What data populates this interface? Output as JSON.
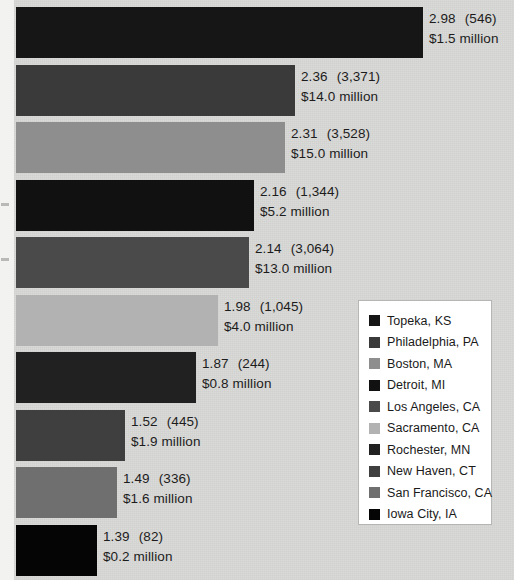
{
  "chart_data": {
    "type": "bar",
    "title": "",
    "subtitle": "",
    "xlabel": "",
    "ylabel": "",
    "orientation": "horizontal",
    "grid": false,
    "legend_position": "right",
    "xlim": [
      0,
      3.2
    ],
    "categories": [
      "Topeka, KS",
      "Philadelphia, PA",
      "Boston, MA",
      "Detroit, MI",
      "Los Angeles, CA",
      "Sacramento, CA",
      "Rochester, MN",
      "New Haven, CT",
      "San Francisco, CA",
      "Iowa City, IA"
    ],
    "values": [
      2.98,
      2.36,
      2.31,
      2.16,
      2.14,
      1.98,
      1.87,
      1.52,
      1.49,
      1.39
    ],
    "counts": [
      "546",
      "3,371",
      "3,528",
      "1,344",
      "3,064",
      "1,045",
      "244",
      "445",
      "336",
      "82"
    ],
    "amounts": [
      "$1.5 million",
      "$14.0 million",
      "$15.0 million",
      "$5.2 million",
      "$13.0 million",
      "$4.0 million",
      "$0.8 million",
      "$1.9 million",
      "$1.6 million",
      "$0.2 million"
    ],
    "colors": [
      "#161616",
      "#3a3a3a",
      "#8e8e8e",
      "#111111",
      "#4a4a4a",
      "#b2b2b2",
      "#212121",
      "#3f3f3f",
      "#6f6f6f",
      "#050505"
    ]
  },
  "bars": [
    {
      "value": "2.98",
      "count": "(546)",
      "amount": "$1.5 million",
      "label": "Topeka, KS",
      "color": "#161616",
      "width": 407,
      "label_x": 413,
      "top": 7
    },
    {
      "value": "2.36",
      "count": "(3,371)",
      "amount": "$14.0 million",
      "label": "Philadelphia, PA",
      "color": "#3a3a3a",
      "width": 279,
      "label_x": 285,
      "top": 65
    },
    {
      "value": "2.31",
      "count": "(3,528)",
      "amount": "$15.0 million",
      "label": "Boston, MA",
      "color": "#8e8e8e",
      "width": 269,
      "label_x": 275,
      "top": 122
    },
    {
      "value": "2.16",
      "count": "(1,344)",
      "amount": "$5.2 million",
      "label": "Detroit, MI",
      "color": "#111111",
      "width": 238,
      "label_x": 244,
      "top": 180
    },
    {
      "value": "2.14",
      "count": "(3,064)",
      "amount": "$13.0 million",
      "label": "Los Angeles, CA",
      "color": "#4a4a4a",
      "width": 233,
      "label_x": 239,
      "top": 237
    },
    {
      "value": "1.98",
      "count": "(1,045)",
      "amount": "$4.0 million",
      "label": "Sacramento, CA",
      "color": "#b2b2b2",
      "width": 202,
      "label_x": 208,
      "top": 295
    },
    {
      "value": "1.87",
      "count": "(244)",
      "amount": "$0.8 million",
      "label": "Rochester, MN",
      "color": "#212121",
      "width": 180,
      "label_x": 186,
      "top": 352
    },
    {
      "value": "1.52",
      "count": "(445)",
      "amount": "$1.9 million",
      "label": "New Haven, CT",
      "color": "#3f3f3f",
      "width": 109,
      "label_x": 115,
      "top": 410
    },
    {
      "value": "1.49",
      "count": "(336)",
      "amount": "$1.6 million",
      "label": "San Francisco, CA",
      "color": "#6f6f6f",
      "width": 101,
      "label_x": 107,
      "top": 467
    },
    {
      "value": "1.39",
      "count": "(82)",
      "amount": "$0.2 million",
      "label": "Iowa City, IA",
      "color": "#050505",
      "width": 81,
      "label_x": 87,
      "top": 525
    }
  ],
  "legend": {
    "items": [
      {
        "label": "Topeka, KS",
        "color": "#161616"
      },
      {
        "label": "Philadelphia, PA",
        "color": "#3a3a3a"
      },
      {
        "label": "Boston, MA",
        "color": "#8e8e8e"
      },
      {
        "label": "Detroit, MI",
        "color": "#111111"
      },
      {
        "label": "Los Angeles, CA",
        "color": "#4a4a4a"
      },
      {
        "label": "Sacramento, CA",
        "color": "#b2b2b2"
      },
      {
        "label": "Rochester, MN",
        "color": "#212121"
      },
      {
        "label": "New Haven, CT",
        "color": "#3f3f3f"
      },
      {
        "label": "San Francisco, CA",
        "color": "#6f6f6f"
      },
      {
        "label": "Iowa City, IA",
        "color": "#050505"
      }
    ]
  }
}
